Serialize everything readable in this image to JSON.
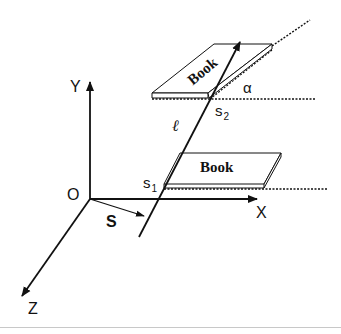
{
  "diagram": {
    "axes": {
      "x_label": "X",
      "y_label": "Y",
      "z_label": "Z",
      "origin_label": "O"
    },
    "vector_label": "S",
    "line_label": "ℓ",
    "points": [
      {
        "label": "s",
        "subscript": "1"
      },
      {
        "label": "s",
        "subscript": "2"
      }
    ],
    "angle_label": "α",
    "books": [
      {
        "label": "Book",
        "orientation": "flat"
      },
      {
        "label": "Book",
        "orientation": "tilted"
      }
    ],
    "colors": {
      "ink": "#111111",
      "background": "#ffffff",
      "divider": "#c8c8c8"
    }
  }
}
